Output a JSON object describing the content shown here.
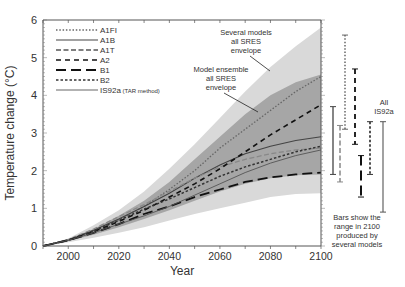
{
  "chart_data": {
    "type": "line",
    "title": "",
    "xlabel": "Year",
    "ylabel": "Temperature change (°C)",
    "xlim": [
      1990,
      2100
    ],
    "ylim": [
      0,
      6
    ],
    "xticks": [
      2000,
      2020,
      2040,
      2060,
      2080,
      2100
    ],
    "yticks": [
      0,
      1,
      2,
      3,
      4,
      5,
      6
    ],
    "grid": false,
    "legend_position": "upper-left",
    "x": [
      1990,
      2000,
      2010,
      2020,
      2030,
      2040,
      2050,
      2060,
      2070,
      2080,
      2090,
      2100
    ],
    "series": [
      {
        "name": "A1FI",
        "style": "dotted",
        "values": [
          0,
          0.16,
          0.4,
          0.7,
          1.05,
          1.5,
          2.0,
          2.6,
          3.1,
          3.6,
          4.1,
          4.5
        ]
      },
      {
        "name": "A1B",
        "style": "solid",
        "values": [
          0,
          0.16,
          0.42,
          0.72,
          1.05,
          1.4,
          1.8,
          2.15,
          2.45,
          2.65,
          2.8,
          2.9
        ]
      },
      {
        "name": "A1T",
        "style": "dashed-gray",
        "values": [
          0,
          0.17,
          0.45,
          0.78,
          1.1,
          1.45,
          1.8,
          2.1,
          2.3,
          2.45,
          2.55,
          2.6
        ]
      },
      {
        "name": "A2",
        "style": "dashed",
        "values": [
          0,
          0.15,
          0.38,
          0.65,
          0.95,
          1.3,
          1.65,
          2.05,
          2.5,
          2.95,
          3.35,
          3.75
        ]
      },
      {
        "name": "B1",
        "style": "long-dash",
        "values": [
          0,
          0.15,
          0.35,
          0.58,
          0.85,
          1.05,
          1.3,
          1.5,
          1.7,
          1.82,
          1.9,
          1.95
        ]
      },
      {
        "name": "B2",
        "style": "short-dash",
        "values": [
          0,
          0.16,
          0.4,
          0.68,
          0.98,
          1.25,
          1.55,
          1.85,
          2.1,
          2.3,
          2.5,
          2.65
        ]
      },
      {
        "name": "IS92a (TAR method)",
        "style": "thin-solid",
        "values": [
          0,
          0.15,
          0.35,
          0.58,
          0.8,
          1.05,
          1.35,
          1.65,
          1.95,
          2.2,
          2.4,
          2.55
        ]
      }
    ],
    "envelopes": [
      {
        "name": "Several models all SRES envelope",
        "upper": [
          0,
          0.2,
          0.55,
          0.95,
          1.45,
          2.05,
          2.7,
          3.4,
          4.1,
          4.75,
          5.3,
          5.8
        ],
        "lower": [
          0,
          0.1,
          0.22,
          0.35,
          0.5,
          0.68,
          0.85,
          1.0,
          1.15,
          1.3,
          1.38,
          1.4
        ]
      },
      {
        "name": "Model ensemble all SRES envelope",
        "upper": [
          0,
          0.18,
          0.45,
          0.8,
          1.2,
          1.7,
          2.3,
          2.9,
          3.5,
          4.0,
          4.35,
          4.55
        ],
        "lower": [
          0,
          0.13,
          0.3,
          0.5,
          0.72,
          0.95,
          1.2,
          1.45,
          1.65,
          1.8,
          1.88,
          1.9
        ]
      }
    ],
    "range_bars_2100": [
      {
        "name": "A1FI",
        "style": "dotted",
        "min": 3.1,
        "max": 5.6
      },
      {
        "name": "A1B",
        "style": "solid",
        "min": 1.9,
        "max": 3.7
      },
      {
        "name": "A1T",
        "style": "dashed-gray",
        "min": 1.7,
        "max": 3.2
      },
      {
        "name": "A2",
        "style": "dashed",
        "min": 2.7,
        "max": 4.7
      },
      {
        "name": "B1",
        "style": "long-dash",
        "min": 1.3,
        "max": 2.4
      },
      {
        "name": "B2",
        "style": "short-dash",
        "min": 1.9,
        "max": 3.3
      },
      {
        "name": "All IS92a",
        "style": "thin-solid",
        "min": 0.9,
        "max": 3.3
      }
    ],
    "annotations": [
      "Several models all SRES envelope",
      "Model ensemble all SRES envelope",
      "Bars show the range in 2100 produced by several models",
      "All IS92a"
    ]
  },
  "labels": {
    "ylabel": "Temperature change (°C)",
    "xlabel": "Year",
    "yticks": [
      "0",
      "1",
      "2",
      "3",
      "4",
      "5",
      "6"
    ],
    "xticks": [
      "2000",
      "2020",
      "2040",
      "2060",
      "2080",
      "2100"
    ],
    "legend": [
      "A1FI",
      "A1B",
      "A1T",
      "A2",
      "B1",
      "B2",
      "IS92a"
    ],
    "legend_suffix": "(TAR method)",
    "ann_several": [
      "Several models",
      "all SRES",
      "envelope"
    ],
    "ann_ensemble": [
      "Model ensemble",
      "all SRES",
      "envelope"
    ],
    "ann_bars": [
      "Bars show the",
      "range in 2100",
      "produced by",
      "several models"
    ],
    "ann_all": [
      "All",
      "IS92a"
    ]
  }
}
